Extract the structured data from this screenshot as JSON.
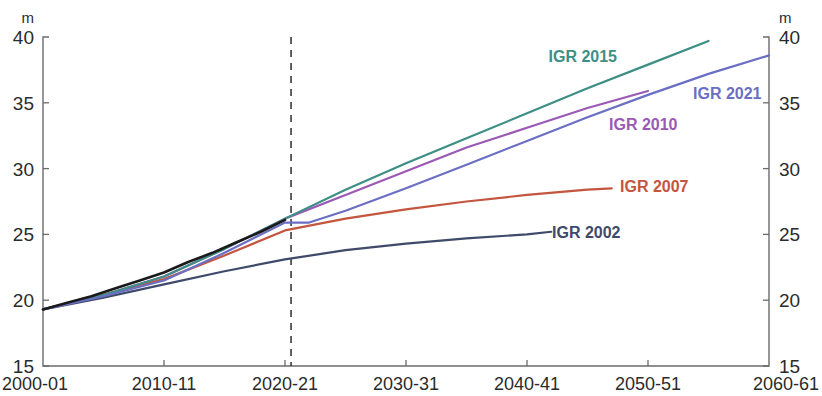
{
  "chart_data": {
    "type": "line",
    "title": "",
    "subtitle": "",
    "xlabel": "",
    "ylabel": "",
    "y_unit_label": "m",
    "ylim": [
      15,
      40
    ],
    "yticks": [
      15,
      20,
      25,
      30,
      35,
      40
    ],
    "ytick_labels": [
      "15",
      "20",
      "25",
      "30",
      "35",
      "40"
    ],
    "xlim": [
      2000,
      2060
    ],
    "xticks": [
      2000,
      2010,
      2020,
      2030,
      2040,
      2050,
      2060
    ],
    "xtick_labels": [
      "2000-01",
      "2010-11",
      "2020-21",
      "2030-31",
      "2040-41",
      "2050-51",
      "2060-61"
    ],
    "grid": false,
    "legend_position": "inline-end-of-line",
    "dual_axis": true,
    "right_axis_labels": [
      "15",
      "20",
      "25",
      "30",
      "35",
      "40"
    ],
    "right_axis_unit_label": "m",
    "annotations": [
      {
        "name": "projection-divider",
        "type": "vertical-dashed-line",
        "x": 2020.5,
        "style": "dashed"
      }
    ],
    "history_series": {
      "name": "History",
      "color": "#1a1a1a",
      "x": [
        2000,
        2002,
        2004,
        2006,
        2008,
        2010,
        2012,
        2014,
        2016,
        2018,
        2020
      ],
      "values": [
        19.3,
        19.8,
        20.3,
        20.9,
        21.5,
        22.1,
        22.9,
        23.6,
        24.4,
        25.2,
        26.1
      ]
    },
    "series": [
      {
        "name": "IGR 2002",
        "label": "IGR 2002",
        "color": "#3f4a6b",
        "x": [
          2000,
          2005,
          2010,
          2015,
          2020,
          2025,
          2030,
          2035,
          2040,
          2042
        ],
        "values": [
          19.3,
          20.2,
          21.2,
          22.2,
          23.1,
          23.8,
          24.3,
          24.7,
          25.0,
          25.2
        ]
      },
      {
        "name": "IGR 2007",
        "label": "IGR 2007",
        "color": "#c4553e",
        "x": [
          2000,
          2005,
          2010,
          2015,
          2020,
          2025,
          2030,
          2035,
          2040,
          2045,
          2047
        ],
        "values": [
          19.3,
          20.4,
          21.6,
          23.4,
          25.3,
          26.2,
          26.9,
          27.5,
          28.0,
          28.4,
          28.5
        ]
      },
      {
        "name": "IGR 2010",
        "label": "IGR 2010",
        "color": "#9b59b6",
        "x": [
          2000,
          2005,
          2010,
          2015,
          2020,
          2025,
          2030,
          2035,
          2040,
          2045,
          2050
        ],
        "values": [
          19.3,
          20.4,
          21.8,
          23.9,
          26.2,
          28.0,
          29.8,
          31.6,
          33.1,
          34.6,
          35.9
        ]
      },
      {
        "name": "IGR 2015",
        "label": "IGR 2015",
        "color": "#3d8f85",
        "x": [
          2000,
          2005,
          2010,
          2015,
          2020,
          2025,
          2030,
          2035,
          2040,
          2045,
          2050,
          2055
        ],
        "values": [
          19.3,
          20.4,
          21.8,
          23.9,
          26.2,
          28.4,
          30.4,
          32.3,
          34.2,
          36.1,
          37.9,
          39.7
        ]
      },
      {
        "name": "IGR 2021",
        "label": "IGR 2021",
        "color": "#6b6fc4",
        "x": [
          2000,
          2005,
          2010,
          2015,
          2020,
          2022,
          2025,
          2030,
          2035,
          2040,
          2045,
          2050,
          2055,
          2060
        ],
        "values": [
          19.3,
          20.3,
          21.5,
          23.6,
          25.9,
          25.9,
          26.8,
          28.5,
          30.3,
          32.1,
          33.9,
          35.6,
          37.2,
          38.6
        ]
      }
    ]
  },
  "labels": {
    "igr2015": "IGR 2015",
    "igr2021": "IGR 2021",
    "igr2010": "IGR 2010",
    "igr2007": "IGR 2007",
    "igr2002": "IGR 2002"
  },
  "axis": {
    "left_unit": "m",
    "right_unit": "m",
    "y0": "15",
    "y1": "20",
    "y2": "25",
    "y3": "30",
    "y4": "35",
    "y5": "40",
    "x0": "2000-01",
    "x1": "2010-11",
    "x2": "2020-21",
    "x3": "2030-31",
    "x4": "2040-41",
    "x5": "2050-51",
    "x6": "2060-61"
  }
}
